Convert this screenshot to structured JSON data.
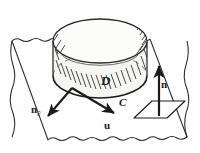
{
  "figure": {
    "kind": "line-diagram",
    "background_color": "#fefefe",
    "ink_color": "#1b1b1b",
    "fill_color": "#f4f4f2",
    "labels": {
      "region": "D",
      "boundary_curve": "C",
      "surface_normal": "n",
      "velocity": "u",
      "boundary_normal_base": "n",
      "boundary_normal_subscript": "∂"
    },
    "icons": {
      "cylinder": "cylinder-solid",
      "wavy_sheet": "wavy-surface-patch",
      "parallelogram": "tangent-plane-patch",
      "arrow_up": "arrow-up-icon",
      "arrow_down_left": "arrow-down-left-icon",
      "arrow_down_right": "arrow-down-right-icon"
    }
  }
}
